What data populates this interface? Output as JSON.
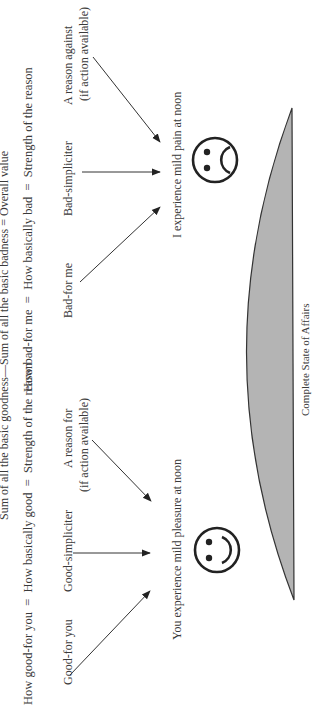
{
  "diagram": {
    "orientation": "rotated-90-ccw",
    "equations": {
      "overall": "Sum of all the basic goodness—Sum of all the basic badness = Overall value",
      "bad_side": "How bad-for me  =  How basically bad  =  Strength of the reason",
      "good_side": "How good-for you  =  How basically good  =  Strength of the reason"
    },
    "bad_side": {
      "sources": {
        "reason_against_line1": "A reason against",
        "reason_against_line2": "(if action available)",
        "bad_simpliciter": "Bad-simpliciter",
        "bad_for_me": "Bad-for me"
      },
      "statement": "I experience mild pain at noon",
      "face": "frowning-face"
    },
    "good_side": {
      "sources": {
        "reason_for_line1": "A reason for",
        "reason_for_line2": "(if action available)",
        "good_simpliciter": "Good-simpliciter",
        "good_for_you": "Good-for you"
      },
      "statement": "You experience mild pleasure at noon",
      "face": "smiling-face"
    },
    "base": {
      "label": "Complete State of Affairs",
      "fill_color": "#b4b4b4",
      "stroke_color": "#333333"
    }
  }
}
